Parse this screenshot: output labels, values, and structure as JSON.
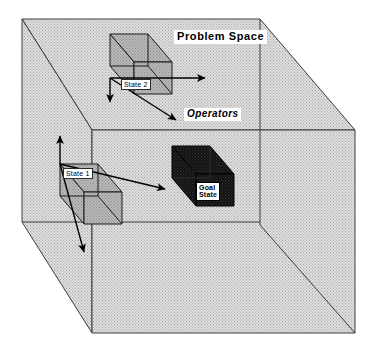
{
  "figure": {
    "kind": "isometric-cube-diagram",
    "title": "Problem Space",
    "background_color": "#ffffff",
    "space_fill_color": "#d0d0d0",
    "space_stroke_color": "#3c3c3c",
    "state_cube_fill_color": "#b3b3b3",
    "state_cube_stroke_color": "#1a1a1a",
    "goal_cube_fill_color": "#141414",
    "arrow_color": "#000000",
    "label_background_color": "#ffffff",
    "label_text_color": "#000000"
  },
  "labels": {
    "title": "Problem Space",
    "state_2": "State 2",
    "state_1": "State 1",
    "goal_state_line1": "Goal",
    "goal_state_line2": "State",
    "operators": "Operators"
  },
  "nodes": [
    {
      "id": "state-2",
      "label": "State 2",
      "type": "state-cube",
      "fill": "#b3b3b3",
      "position": {
        "x": 110,
        "y": 34
      },
      "size": {
        "w": 62,
        "h": 60
      }
    },
    {
      "id": "state-1",
      "label": "State 1",
      "type": "state-cube",
      "fill": "#b3b3b3",
      "position": {
        "x": 60,
        "y": 164
      },
      "size": {
        "w": 62,
        "h": 60
      }
    },
    {
      "id": "goal-state",
      "label": "Goal State",
      "type": "goal-cube",
      "fill": "#141414",
      "position": {
        "x": 172,
        "y": 146
      },
      "size": {
        "w": 62,
        "h": 60
      }
    }
  ],
  "arrows": [
    {
      "id": "state2-right",
      "from": "state-2",
      "direction": "right",
      "label": "Operators"
    },
    {
      "id": "state2-down",
      "from": "state-2",
      "direction": "down",
      "label": ""
    },
    {
      "id": "state2-depth",
      "from": "state-2",
      "direction": "down-right",
      "label": "Operators"
    },
    {
      "id": "state1-right",
      "from": "state-1",
      "direction": "right",
      "label": ""
    },
    {
      "id": "state1-up",
      "from": "state-1",
      "direction": "up",
      "label": ""
    },
    {
      "id": "state1-depth",
      "from": "state-1",
      "direction": "down-left",
      "label": ""
    }
  ]
}
